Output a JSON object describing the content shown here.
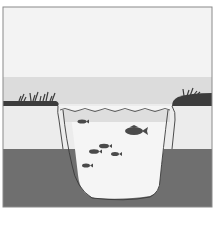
{
  "diagram": {
    "fish_count": 6,
    "colors": {
      "background": "#ffffff",
      "frame": "#8a8a8a",
      "sky": "#f2f2f2",
      "horizon_band": "#dcdcdc",
      "ground_upper": "#ececec",
      "ground_lower": "#6e6e6e",
      "bank": "#3c3c3c",
      "water_surface_band": "#d9d9d9",
      "water": "#f4f4f4",
      "outline": "#3a3a3a",
      "fish": "#4a4a4a"
    }
  }
}
